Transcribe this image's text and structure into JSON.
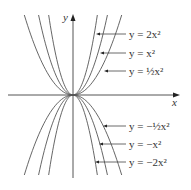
{
  "figure": {
    "type": "graph-of-parabolas",
    "axes": {
      "x_label": "x",
      "y_label": "y"
    },
    "origin_px": [
      73,
      95
    ],
    "colors": {
      "curve": "#555555",
      "axis": "#555555",
      "text": "#333333"
    },
    "curves": [
      {
        "id": "pos-2",
        "coef": 2,
        "label": "y = 2x²",
        "label_y": 34,
        "arrow_x": 96
      },
      {
        "id": "pos-1",
        "coef": 1,
        "label": "y = x²",
        "label_y": 53,
        "arrow_x": 100
      },
      {
        "id": "pos-half",
        "coef": 0.5,
        "label": "y = ½x²",
        "label_y": 71,
        "arrow_x": 104
      },
      {
        "id": "neg-half",
        "coef": -0.5,
        "label": "y = −½x²",
        "label_y": 126,
        "arrow_x": 103
      },
      {
        "id": "neg-1",
        "coef": -1,
        "label": "y = −x²",
        "label_y": 144,
        "arrow_x": 99
      },
      {
        "id": "neg-2",
        "coef": -2,
        "label": "y = −2x²",
        "label_y": 162,
        "arrow_x": 95
      }
    ]
  }
}
